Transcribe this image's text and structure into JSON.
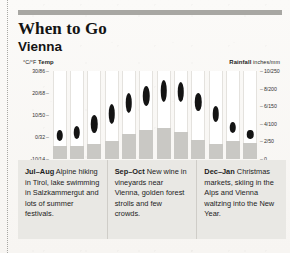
{
  "header": {
    "title": "When to Go",
    "subtitle": "Vienna"
  },
  "chart_data": {
    "type": "bar",
    "categories": [
      "J",
      "F",
      "M",
      "A",
      "M",
      "J",
      "J",
      "A",
      "S",
      "O",
      "N",
      "D"
    ],
    "left_axis": {
      "label_units": "°C/°F",
      "label_name": "Temp",
      "ticks": [
        "30/86",
        "20/68",
        "10/50",
        "0/32",
        "-10/14"
      ],
      "tick_values_c": [
        30,
        20,
        10,
        0,
        -10
      ],
      "ylim": [
        -10,
        30
      ]
    },
    "right_axis": {
      "label_name": "Rainfall",
      "label_units": "inches/mm",
      "ticks": [
        "10/250",
        "8/200",
        "6/150",
        "4/100",
        "2/50",
        "0"
      ],
      "tick_values_in": [
        10,
        8,
        6,
        4,
        2,
        0
      ],
      "ylim": [
        0,
        10
      ]
    },
    "grid": false,
    "legend": "none",
    "series": [
      {
        "name": "Temp range (°C low–high)",
        "type": "range-marker",
        "unit": "°C",
        "low": [
          -2,
          -1,
          2,
          6,
          11,
          14,
          16,
          16,
          12,
          7,
          2,
          -1
        ],
        "high": [
          3,
          5,
          10,
          15,
          20,
          23,
          26,
          25,
          20,
          14,
          7,
          3
        ]
      },
      {
        "name": "Rainfall",
        "type": "bar",
        "unit": "inches",
        "values": [
          1.5,
          1.5,
          1.7,
          2.1,
          2.8,
          3.3,
          3.5,
          3.1,
          2.2,
          1.7,
          2.0,
          1.8
        ]
      }
    ]
  },
  "notes": [
    {
      "period": "Jul–Aug",
      "text": " Alpine hiking in Tirol, lake swimming in Salzkammergut and lots of summer festivals."
    },
    {
      "period": "Sep–Oct",
      "text": " New wine in vineyards near Vienna, golden forest strolls and few crowds."
    },
    {
      "period": "Dec–Jan",
      "text": " Christmas markets, skiing in the Alps and Vienna waltzing into the New Year."
    }
  ]
}
